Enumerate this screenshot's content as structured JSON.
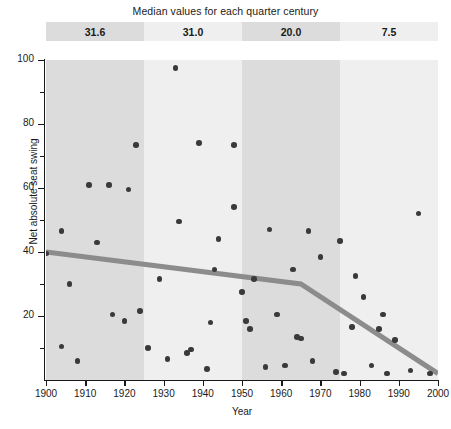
{
  "banner": {
    "title": "Median values for each quarter century",
    "cells": [
      {
        "label": "31.6",
        "period": "1900-1925",
        "bg": "#dcdcdc"
      },
      {
        "label": "31.0",
        "period": "1925-1950",
        "bg": "#efefef"
      },
      {
        "label": "20.0",
        "period": "1950-1975",
        "bg": "#dcdcdc"
      },
      {
        "label": "7.5",
        "period": "1975-2000",
        "bg": "#efefef"
      }
    ]
  },
  "chart_data": {
    "type": "scatter",
    "title": "Median values for each quarter century",
    "xlabel": "Year",
    "ylabel": "Net absolute seat swing",
    "xlim": [
      1900,
      2000
    ],
    "ylim": [
      0,
      100
    ],
    "grid": false,
    "legend": null,
    "xticks": [
      1900,
      1910,
      1920,
      1930,
      1940,
      1950,
      1960,
      1970,
      1980,
      1990,
      2000
    ],
    "yticks": [
      20,
      40,
      60,
      80,
      100
    ],
    "yticks_minor": [
      10,
      30,
      50,
      70,
      90
    ],
    "point_color": "#3a3a3a",
    "trend_color": "#8c8c8c",
    "bands": [
      {
        "x0": 1900,
        "x1": 1925,
        "color": "#dcdcdc",
        "median": 31.6
      },
      {
        "x0": 1925,
        "x1": 1950,
        "color": "#efefef",
        "median": 31.0
      },
      {
        "x0": 1950,
        "x1": 1975,
        "color": "#dcdcdc",
        "median": 20.0
      },
      {
        "x0": 1975,
        "x1": 2000,
        "color": "#efefef",
        "median": 7.5
      }
    ],
    "trend_line": {
      "name": "Trend",
      "points": [
        {
          "x": 1900,
          "y": 40.0
        },
        {
          "x": 1965,
          "y": 30.0
        },
        {
          "x": 2000,
          "y": 2.0
        }
      ]
    },
    "points": [
      {
        "x": 1900,
        "y": 39.5
      },
      {
        "x": 1904,
        "y": 46.5
      },
      {
        "x": 1904,
        "y": 10.5
      },
      {
        "x": 1906,
        "y": 30.0
      },
      {
        "x": 1908,
        "y": 6.0
      },
      {
        "x": 1911,
        "y": 61.0
      },
      {
        "x": 1913,
        "y": 43.0
      },
      {
        "x": 1916,
        "y": 61.0
      },
      {
        "x": 1917,
        "y": 20.5
      },
      {
        "x": 1920,
        "y": 18.5
      },
      {
        "x": 1921,
        "y": 59.5
      },
      {
        "x": 1923,
        "y": 73.5
      },
      {
        "x": 1924,
        "y": 21.5
      },
      {
        "x": 1926,
        "y": 10.0
      },
      {
        "x": 1929,
        "y": 31.5
      },
      {
        "x": 1931,
        "y": 6.5
      },
      {
        "x": 1933,
        "y": 97.5
      },
      {
        "x": 1934,
        "y": 49.5
      },
      {
        "x": 1936,
        "y": 8.5
      },
      {
        "x": 1937,
        "y": 9.5
      },
      {
        "x": 1939,
        "y": 74.0
      },
      {
        "x": 1941,
        "y": 3.5
      },
      {
        "x": 1942,
        "y": 18.0
      },
      {
        "x": 1943,
        "y": 34.5
      },
      {
        "x": 1944,
        "y": 44.0
      },
      {
        "x": 1948,
        "y": 73.5
      },
      {
        "x": 1948,
        "y": 54.0
      },
      {
        "x": 1950,
        "y": 27.5
      },
      {
        "x": 1951,
        "y": 18.5
      },
      {
        "x": 1952,
        "y": 16.0
      },
      {
        "x": 1953,
        "y": 31.5
      },
      {
        "x": 1956,
        "y": 4.0
      },
      {
        "x": 1957,
        "y": 47.0
      },
      {
        "x": 1959,
        "y": 20.5
      },
      {
        "x": 1961,
        "y": 4.5
      },
      {
        "x": 1963,
        "y": 34.5
      },
      {
        "x": 1964,
        "y": 13.5
      },
      {
        "x": 1965,
        "y": 13.0
      },
      {
        "x": 1967,
        "y": 46.5
      },
      {
        "x": 1968,
        "y": 6.0
      },
      {
        "x": 1970,
        "y": 38.5
      },
      {
        "x": 1974,
        "y": 2.5
      },
      {
        "x": 1975,
        "y": 43.5
      },
      {
        "x": 1976,
        "y": 2.0
      },
      {
        "x": 1978,
        "y": 16.5
      },
      {
        "x": 1979,
        "y": 32.5
      },
      {
        "x": 1981,
        "y": 26.0
      },
      {
        "x": 1983,
        "y": 4.5
      },
      {
        "x": 1985,
        "y": 16.0
      },
      {
        "x": 1986,
        "y": 20.5
      },
      {
        "x": 1987,
        "y": 2.0
      },
      {
        "x": 1989,
        "y": 12.5
      },
      {
        "x": 1993,
        "y": 3.0
      },
      {
        "x": 1995,
        "y": 52.0
      },
      {
        "x": 1998,
        "y": 2.0
      }
    ]
  }
}
